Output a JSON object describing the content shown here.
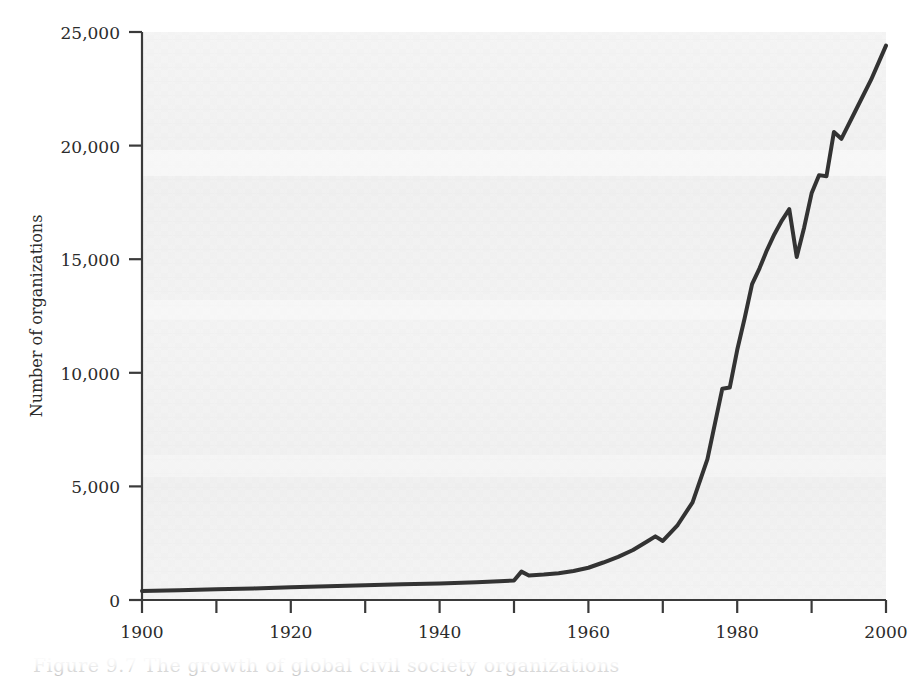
{
  "figure": {
    "caption": "Figure 9.7  The growth of global civil society organizations"
  },
  "chart_data": {
    "type": "line",
    "title": "",
    "subtitle": "",
    "xlabel": "",
    "ylabel": "Number of organizations",
    "xlim": [
      1900,
      2000
    ],
    "ylim": [
      0,
      25000
    ],
    "grid": false,
    "legend": false,
    "legend_position": "none",
    "line_color": "#333333",
    "background_color": "#f2f2f2",
    "y_ticks": [
      0,
      5000,
      10000,
      15000,
      20000,
      25000
    ],
    "y_tick_labels": [
      "0",
      "5,000",
      "10,000",
      "15,000",
      "20,000",
      "25,000"
    ],
    "x_ticks_major": [
      1900,
      1920,
      1940,
      1960,
      1980,
      2000
    ],
    "x_tick_labels": [
      "1900",
      "1920",
      "1940",
      "1960",
      "1980",
      "2000"
    ],
    "x_ticks_minor": [
      1910,
      1930,
      1950,
      1970,
      1990
    ],
    "series": [
      {
        "name": "Global civil society organizations",
        "x": [
          1900,
          1905,
          1910,
          1915,
          1920,
          1925,
          1930,
          1935,
          1940,
          1945,
          1948,
          1950,
          1951,
          1952,
          1954,
          1956,
          1958,
          1960,
          1962,
          1964,
          1966,
          1968,
          1969,
          1970,
          1972,
          1974,
          1976,
          1978,
          1979,
          1980,
          1981,
          1982,
          1983,
          1984,
          1985,
          1986,
          1987,
          1988,
          1989,
          1990,
          1991,
          1992,
          1993,
          1994,
          1996,
          1998,
          2000
        ],
        "y": [
          400,
          430,
          470,
          510,
          560,
          600,
          650,
          690,
          730,
          780,
          820,
          860,
          1250,
          1080,
          1120,
          1180,
          1280,
          1420,
          1650,
          1900,
          2200,
          2600,
          2800,
          2600,
          3300,
          4300,
          6200,
          9300,
          9350,
          11000,
          12400,
          13900,
          14600,
          15400,
          16100,
          16700,
          17200,
          15100,
          16400,
          17900,
          18700,
          18650,
          20600,
          20300,
          21600,
          22900,
          24400
        ]
      }
    ],
    "annotations": []
  }
}
